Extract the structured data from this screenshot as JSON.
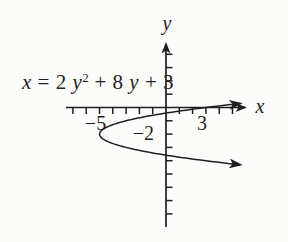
{
  "figure": {
    "equation_label": {
      "full": "x = 2y² + 8y + 3",
      "parts": [
        {
          "text": "x",
          "italic": true,
          "sup": false
        },
        {
          "text": " = 2 ",
          "italic": false,
          "sup": false
        },
        {
          "text": "y",
          "italic": true,
          "sup": false
        },
        {
          "text": "2",
          "italic": false,
          "sup": true
        },
        {
          "text": " + 8 ",
          "italic": false,
          "sup": false
        },
        {
          "text": "y",
          "italic": true,
          "sup": false
        },
        {
          "text": " + 3",
          "italic": false,
          "sup": false
        }
      ]
    },
    "x_axis_label": "x",
    "y_axis_label": "y"
  },
  "chart_data": {
    "type": "line",
    "title": "",
    "equation_text": "x = 2y² + 8y + 3",
    "equation": {
      "form": "x = a*y^2 + b*y + c",
      "a": 2,
      "b": 8,
      "c": 3
    },
    "vertex": {
      "x": -5,
      "y": -2
    },
    "x_intercept_at_y0": 3,
    "opens": "right",
    "grid": false,
    "axes": {
      "x_label": "x",
      "y_label": "y",
      "x_range_shown": [
        -7.5,
        6.2
      ],
      "y_range_shown": [
        -9.0,
        5.0
      ],
      "tick_step": 1
    },
    "tick_labels": [
      {
        "axis": "x",
        "value": -5,
        "label": "−5"
      },
      {
        "axis": "y",
        "value": -2,
        "label": "−2"
      },
      {
        "axis": "x",
        "value": 3,
        "label": "3"
      }
    ],
    "y_plot_range": [
      -4.3,
      0.3
    ]
  },
  "colors": {
    "ink": "#1f1f1f",
    "background": "#fcfcfb"
  }
}
